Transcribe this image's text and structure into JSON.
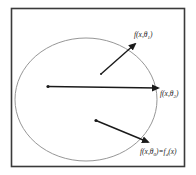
{
  "diagram": {
    "labels": {
      "theta1": {
        "prefix": "f(x,θ",
        "sub": "1",
        "suffix": ")"
      },
      "theta2": {
        "prefix": "f(x,θ",
        "sub": "2",
        "suffix": ")"
      },
      "theta0": {
        "prefix": "f(x,θ",
        "sub": "0",
        "mid": ")=f",
        "sub2": "d",
        "suffix": "(x)"
      }
    },
    "arrows": [
      {
        "name": "arrow-theta1",
        "target": "theta1"
      },
      {
        "name": "arrow-theta2",
        "target": "theta2"
      },
      {
        "name": "arrow-theta0",
        "target": "theta0"
      }
    ],
    "colors": {
      "frame": "#3a3a3a",
      "ellipse": "#8a8a8a",
      "arrow": "#1a1a1a",
      "text": "#222222"
    }
  }
}
